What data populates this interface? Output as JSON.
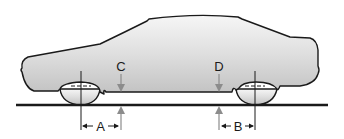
{
  "diagram": {
    "type": "vehicle-ride-height-measurement",
    "labels": {
      "a": "A",
      "b": "B",
      "c": "C",
      "d": "D"
    },
    "colors": {
      "outline": "#1a1a1a",
      "body_fill_top": "#f4f4f4",
      "body_fill_bottom": "#c4c4c4",
      "arrow": "#8c8c8c",
      "ground": "#1a1a1a"
    }
  }
}
